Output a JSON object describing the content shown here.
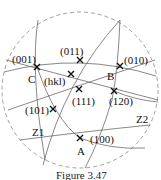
{
  "figure": {
    "caption": "Figure 3.47",
    "primitive_circle": {
      "style": "dashed"
    },
    "poles": [
      {
        "id": "p001",
        "label": "(001)",
        "x": 37,
        "y": 67,
        "lx": 12,
        "ly": 63
      },
      {
        "id": "p011",
        "label": "(011)",
        "x": 80,
        "y": 60,
        "lx": 60,
        "ly": 55
      },
      {
        "id": "p010",
        "label": "(010)",
        "x": 120,
        "y": 66,
        "lx": 125,
        "ly": 64
      },
      {
        "id": "phkl",
        "label": "(hkl)",
        "x": 71,
        "y": 74,
        "lx": 44,
        "ly": 85
      },
      {
        "id": "p111",
        "label": "(111)",
        "x": 79,
        "y": 89,
        "lx": 72,
        "ly": 105
      },
      {
        "id": "p120",
        "label": "(120)",
        "x": 114,
        "y": 91,
        "lx": 109,
        "ly": 105
      },
      {
        "id": "p101",
        "label": "(101)",
        "x": 53,
        "y": 109,
        "lx": 26,
        "ly": 114
      },
      {
        "id": "p100",
        "label": "(100)",
        "x": 80,
        "y": 138,
        "lx": 90,
        "ly": 143
      }
    ],
    "points": [
      {
        "id": "A",
        "label": "A",
        "x": 77,
        "y": 155
      },
      {
        "id": "B",
        "label": "B",
        "x": 108,
        "y": 79
      },
      {
        "id": "C",
        "label": "C",
        "x": 29,
        "y": 82
      }
    ],
    "zones": [
      {
        "id": "Z1",
        "label": "Z1",
        "x": 33,
        "y": 136
      },
      {
        "id": "Z2",
        "label": "Z2",
        "x": 137,
        "y": 123
      }
    ]
  }
}
